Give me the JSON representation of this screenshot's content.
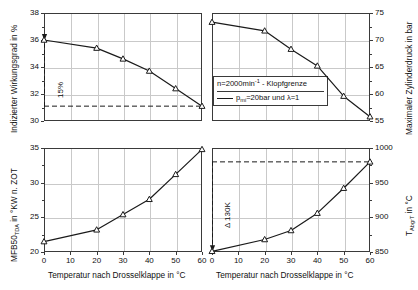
{
  "figure": {
    "xlabel": "Temperatur nach Drosselklappe  in °C",
    "x_ticks": [
      "0",
      "10",
      "20",
      "30",
      "40",
      "50",
      "60"
    ]
  },
  "legend": {
    "line1_pre": "n=2000min",
    "line1_sup": "-1",
    "line1_post": " - Klopfgrenze",
    "line2_pre": "p",
    "line2_sub": "mi",
    "line2_post": "=20bar und λ=1"
  },
  "chart_data": [
    {
      "type": "line",
      "panel": "top-left",
      "title": "",
      "xlabel": "Temperatur nach Drosselklappe  in °C",
      "ylabel_pre": "Indizierter Wirkungsgrad in %",
      "ylabel": "Indizierter Wirkungsgrad in %",
      "x": [
        0,
        10,
        20,
        30,
        40,
        50,
        60
      ],
      "values": [
        36.0,
        35.4,
        34.6,
        33.7,
        32.4,
        31.1
      ],
      "x_points": [
        0,
        20,
        30,
        40,
        50,
        60
      ],
      "xlim": [
        0,
        60
      ],
      "ylim": [
        30,
        38
      ],
      "y_ticks": [
        "30",
        "32",
        "34",
        "36",
        "38"
      ],
      "y_tickvals": [
        30,
        32,
        34,
        36,
        38
      ],
      "grid": true,
      "marker": "triangle-up-open",
      "reference_line": {
        "y": 31.1,
        "style": "dashed"
      },
      "annotation": {
        "text": "15%",
        "rotation": -90,
        "arrow": "down-at-x0"
      }
    },
    {
      "type": "line",
      "panel": "top-right",
      "title": "",
      "xlabel": "Temperatur nach Drosselklappe  in °C",
      "ylabel": "Maximaler Zylinderdruck in bar",
      "x": [
        0,
        20,
        30,
        40,
        50,
        60
      ],
      "values": [
        73.3,
        71.7,
        68.3,
        65.2,
        59.6,
        55.8
      ],
      "x_points": [
        0,
        20,
        30,
        40,
        50,
        60
      ],
      "xlim": [
        0,
        60
      ],
      "ylim": [
        55,
        75
      ],
      "y_ticks": [
        "55",
        "60",
        "65",
        "70",
        "75"
      ],
      "y_tickvals": [
        55,
        60,
        65,
        70,
        75
      ],
      "grid": true,
      "marker": "triangle-up-open",
      "legend_position": "lower-left"
    },
    {
      "type": "line",
      "panel": "bottom-left",
      "title": "",
      "xlabel": "Temperatur nach Drosselklappe  in °C",
      "ylabel": "MFB50TDA in °KW n. ZOT",
      "ylabel_pre": "MFB50",
      "ylabel_sub": "TDA",
      "ylabel_post": " in °KW n. ZOT",
      "x": [
        0,
        20,
        30,
        40,
        50,
        60
      ],
      "values": [
        21.5,
        23.2,
        25.4,
        27.6,
        31.2,
        34.8
      ],
      "x_points": [
        0,
        20,
        30,
        40,
        50,
        60
      ],
      "xlim": [
        0,
        60
      ],
      "ylim": [
        20,
        35
      ],
      "y_ticks": [
        "20",
        "25",
        "30",
        "35"
      ],
      "y_tickvals": [
        20,
        25,
        30,
        35
      ],
      "grid": true,
      "marker": "triangle-up-open"
    },
    {
      "type": "line",
      "panel": "bottom-right",
      "title": "",
      "xlabel": "Temperatur nach Drosselklappe  in °C",
      "ylabel": "TAbgrT in °C",
      "ylabel_pre": "T",
      "ylabel_sub": "AbgrT",
      "ylabel_post": " in °C",
      "x": [
        0,
        20,
        30,
        40,
        50,
        60
      ],
      "values": [
        851,
        868,
        881,
        906,
        942,
        980
      ],
      "x_points": [
        0,
        20,
        30,
        40,
        50,
        60
      ],
      "xlim": [
        0,
        60
      ],
      "ylim": [
        850,
        1000
      ],
      "y_ticks": [
        "850",
        "900",
        "950",
        "1000"
      ],
      "y_tickvals": [
        850,
        900,
        950,
        1000
      ],
      "grid": true,
      "marker": "triangle-up-open",
      "reference_line": {
        "y": 980,
        "style": "dashed"
      },
      "annotation": {
        "text": "Δ 130K",
        "rotation": -90,
        "arrow": "down-at-x0"
      }
    }
  ]
}
